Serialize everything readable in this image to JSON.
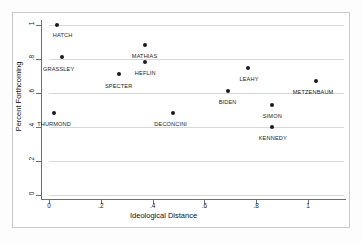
{
  "chart_data": {
    "type": "scatter",
    "title": "",
    "xlabel": "Ideological Distance",
    "ylabel": "Percent Forthcoming",
    "xlim": [
      -0.05,
      1.14
    ],
    "ylim": [
      0,
      1.06
    ],
    "grid": true,
    "legend": "none",
    "xticks": [
      {
        "value": 0,
        "label": "0"
      },
      {
        "value": 0.2,
        "label": ".2"
      },
      {
        "value": 0.4,
        "label": ".4"
      },
      {
        "value": 0.6,
        "label": ".6"
      },
      {
        "value": 0.8,
        "label": ".8"
      },
      {
        "value": 1,
        "label": "1"
      }
    ],
    "yticks": [
      {
        "value": 0,
        "label": "0"
      },
      {
        "value": 0.2,
        "label": ".2"
      },
      {
        "value": 0.4,
        "label": ".4"
      },
      {
        "value": 0.6,
        "label": ".6"
      },
      {
        "value": 0.8,
        "label": ".8"
      },
      {
        "value": 1,
        "label": "1"
      }
    ],
    "points": [
      {
        "label": "HATCH",
        "x": 0.03,
        "y": 1.0,
        "label_dx": -4,
        "label_dy": 7
      },
      {
        "label": "GRASSLEY",
        "x": 0.05,
        "y": 0.81,
        "label_dx": -19,
        "label_dy": 9
      },
      {
        "label": "THURMOND",
        "x": 0.02,
        "y": 0.48,
        "label_dx": -17,
        "label_dy": 8
      },
      {
        "label": "SPECTER",
        "x": 0.27,
        "y": 0.71,
        "label_dx": -14,
        "label_dy": 9
      },
      {
        "label": "MATHIAS",
        "x": 0.37,
        "y": 0.88,
        "label_dx": -13,
        "label_dy": 8
      },
      {
        "label": "HEFLIN",
        "x": 0.37,
        "y": 0.78,
        "label_dx": -10,
        "label_dy": 8
      },
      {
        "label": "DECONCINI",
        "x": 0.48,
        "y": 0.48,
        "label_dx": -19,
        "label_dy": 8
      },
      {
        "label": "BIDEN",
        "x": 0.69,
        "y": 0.61,
        "label_dx": -9,
        "label_dy": 8
      },
      {
        "label": "LEAHY",
        "x": 0.77,
        "y": 0.75,
        "label_dx": -9,
        "label_dy": 8
      },
      {
        "label": "SIMON",
        "x": 0.86,
        "y": 0.53,
        "label_dx": -9,
        "label_dy": 8
      },
      {
        "label": "KENNEDY",
        "x": 0.86,
        "y": 0.4,
        "label_dx": -13,
        "label_dy": 8
      },
      {
        "label": "METZENBAUM",
        "x": 1.03,
        "y": 0.67,
        "label_dx": -23,
        "label_dy": 8
      }
    ],
    "colors": {
      "marker": "#1b1b1b",
      "grid": "#d8d8d8",
      "axis": "#6f6f6f",
      "frame": "#c9c9c9",
      "background": "#ffffff"
    }
  }
}
